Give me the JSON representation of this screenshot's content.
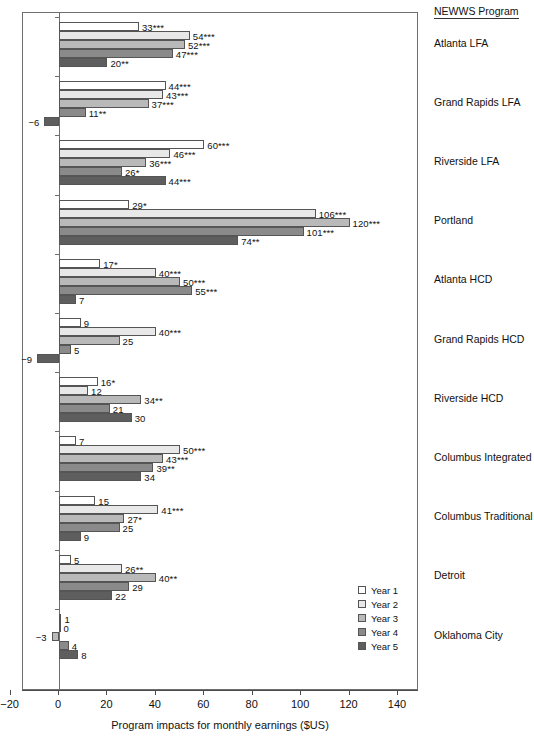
{
  "right_panel": {
    "header": "NEWWS Program"
  },
  "axis": {
    "title": "Program impacts for monthly earnings  ($US)",
    "ticks": [
      -20,
      0,
      20,
      40,
      60,
      80,
      100,
      120,
      140
    ],
    "tick_labels": [
      "−20",
      "0",
      "20",
      "40",
      "60",
      "80",
      "100",
      "120",
      "140"
    ],
    "xmin": -20,
    "xmax": 150
  },
  "legend": {
    "position": "inside-bottom-right",
    "entries": [
      {
        "label": "Year 1",
        "color": "#ffffff"
      },
      {
        "label": "Year 2",
        "color": "#e8e8e8"
      },
      {
        "label": "Year 3",
        "color": "#b9b9b9"
      },
      {
        "label": "Year 4",
        "color": "#8a8a8a"
      },
      {
        "label": "Year 5",
        "color": "#5e5e5e"
      }
    ]
  },
  "chart_data": {
    "type": "bar",
    "orientation": "horizontal",
    "title": "",
    "xlabel": "Program impacts for monthly earnings  ($US)",
    "ylabel": "NEWWS Program",
    "xlim": [
      -20,
      150
    ],
    "grid": false,
    "legend_position": "inside-bottom-right",
    "series_names": [
      "Year 1",
      "Year 2",
      "Year 3",
      "Year 4",
      "Year 5"
    ],
    "series_colors": [
      "#ffffff",
      "#e8e8e8",
      "#b9b9b9",
      "#8a8a8a",
      "#5e5e5e"
    ],
    "categories": [
      "Atlanta LFA",
      "Grand Rapids LFA",
      "Riverside LFA",
      "Portland",
      "Atlanta HCD",
      "Grand Rapids HCD",
      "Riverside HCD",
      "Columbus Integrated",
      "Columbus Traditional",
      "Detroit",
      "Oklahoma City"
    ],
    "series": [
      {
        "name": "Year 1",
        "values": [
          33,
          44,
          60,
          29,
          17,
          9,
          16,
          7,
          15,
          5,
          1
        ]
      },
      {
        "name": "Year 2",
        "values": [
          54,
          43,
          46,
          106,
          40,
          40,
          12,
          50,
          41,
          26,
          0
        ]
      },
      {
        "name": "Year 3",
        "values": [
          52,
          37,
          36,
          120,
          50,
          25,
          34,
          43,
          27,
          40,
          -3
        ]
      },
      {
        "name": "Year 4",
        "values": [
          47,
          11,
          26,
          101,
          55,
          5,
          21,
          39,
          25,
          29,
          4
        ]
      },
      {
        "name": "Year 5",
        "values": [
          20,
          -6,
          44,
          74,
          7,
          -9,
          30,
          34,
          9,
          22,
          8
        ]
      }
    ],
    "data_labels": [
      {
        "category": "Atlanta LFA",
        "labels": [
          "33***",
          "54***",
          "52***",
          "47***",
          "20**"
        ]
      },
      {
        "category": "Grand Rapids LFA",
        "labels": [
          "44***",
          "43***",
          "37***",
          "11**",
          "−6"
        ]
      },
      {
        "category": "Riverside LFA",
        "labels": [
          "60***",
          "46***",
          "36***",
          "26*",
          "44***"
        ]
      },
      {
        "category": "Portland",
        "labels": [
          "29*",
          "106***",
          "120***",
          "101***",
          "74**"
        ]
      },
      {
        "category": "Atlanta HCD",
        "labels": [
          "17*",
          "40***",
          "50***",
          "55***",
          "7"
        ]
      },
      {
        "category": "Grand Rapids HCD",
        "labels": [
          "9",
          "40***",
          "25",
          "5",
          "−9"
        ]
      },
      {
        "category": "Riverside HCD",
        "labels": [
          "16*",
          "12",
          "34**",
          "21",
          "30"
        ]
      },
      {
        "category": "Columbus Integrated",
        "labels": [
          "7",
          "50***",
          "43***",
          "39**",
          "34"
        ]
      },
      {
        "category": "Columbus Traditional",
        "labels": [
          "15",
          "41***",
          "27*",
          "25",
          "9"
        ]
      },
      {
        "category": "Detroit",
        "labels": [
          "5",
          "26**",
          "40**",
          "29",
          "22"
        ]
      },
      {
        "category": "Oklahoma City",
        "labels": [
          "1",
          "0",
          "−3",
          "4",
          "8"
        ]
      }
    ]
  }
}
